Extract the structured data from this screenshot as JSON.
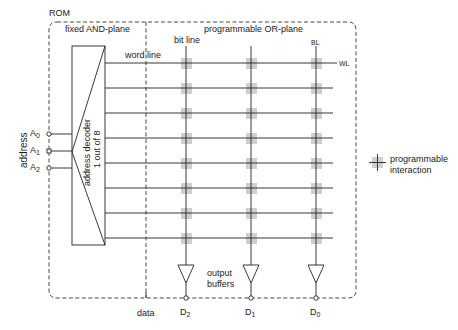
{
  "title": "ROM",
  "planes": {
    "and_plane": "fixed AND-plane",
    "or_plane": "programmable OR-plane"
  },
  "labels": {
    "word_line": "word line",
    "bit_line": "bit line",
    "bl": "BL",
    "wl": "WL",
    "address": "address",
    "data": "data",
    "output_buffers_1": "output",
    "output_buffers_2": "buffers"
  },
  "decoder": {
    "line1": "address decoder",
    "line2": "1 out of 8"
  },
  "address_inputs": [
    {
      "name": "A",
      "sub": "0"
    },
    {
      "name": "A",
      "sub": "1"
    },
    {
      "name": "A",
      "sub": "2"
    }
  ],
  "data_outputs": [
    {
      "name": "D",
      "sub": "2"
    },
    {
      "name": "D",
      "sub": "1"
    },
    {
      "name": "D",
      "sub": "0"
    }
  ],
  "legend": {
    "line1": "programmable",
    "line2": "interaction"
  },
  "structure": {
    "word_line_count": 8,
    "bit_line_count": 3,
    "cell_color": "#cccccc",
    "line_color": "#222222"
  }
}
